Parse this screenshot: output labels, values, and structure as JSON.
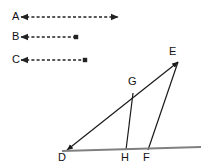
{
  "figure": {
    "background_color": "#ffffff",
    "stroke_color": "#1a1a1a",
    "baseline_color": "#808080",
    "dash_color": "#222222"
  },
  "rays": [
    {
      "label": "A",
      "label_x": 12,
      "label_y": 11,
      "x1": 21,
      "y1": 17,
      "x2": 118,
      "y2": 17,
      "arrow_start": true,
      "arrow_end": true,
      "style": "dashed",
      "name": "ray-a"
    },
    {
      "label": "B",
      "label_x": 12,
      "label_y": 31,
      "x1": 21,
      "y1": 37,
      "x2": 76,
      "y2": 37,
      "arrow_start": true,
      "arrow_end": false,
      "style": "dashed",
      "name": "ray-b"
    },
    {
      "label": "C",
      "label_x": 12,
      "label_y": 54,
      "x1": 21,
      "y1": 60,
      "x2": 85,
      "y2": 60,
      "arrow_start": true,
      "arrow_end": false,
      "style": "dashed",
      "name": "ray-c"
    }
  ],
  "points": [
    {
      "label": "D",
      "x": 67,
      "y": 150,
      "label_x": 58,
      "label_y": 152,
      "name": "point-d"
    },
    {
      "label": "E",
      "x": 178,
      "y": 62,
      "label_x": 169,
      "label_y": 46,
      "name": "point-e"
    },
    {
      "label": "G",
      "x": 133,
      "y": 93,
      "label_x": 128,
      "label_y": 76,
      "name": "point-g"
    },
    {
      "label": "H",
      "x": 126,
      "y": 150,
      "label_x": 121,
      "label_y": 152,
      "name": "point-h"
    },
    {
      "label": "F",
      "x": 148,
      "y": 150,
      "label_x": 143,
      "label_y": 152,
      "name": "point-f"
    }
  ],
  "segments": [
    {
      "name": "segment-de",
      "from": "D",
      "to": "E",
      "x1": 67,
      "y1": 150,
      "x2": 178,
      "y2": 62,
      "arrow_start": true,
      "arrow_end": true
    },
    {
      "name": "segment-gh",
      "from": "G",
      "to": "H",
      "x1": 133,
      "y1": 93,
      "x2": 126,
      "y2": 150,
      "arrow_start": false,
      "arrow_end": false
    },
    {
      "name": "segment-ef",
      "from": "E",
      "to": "F",
      "x1": 178,
      "y1": 62,
      "x2": 148,
      "y2": 150,
      "arrow_start": false,
      "arrow_end": false
    },
    {
      "name": "baseline",
      "from": "left",
      "to": "right",
      "x1": 62,
      "y1": 151,
      "x2": 201,
      "y2": 147,
      "arrow_start": false,
      "arrow_end": false
    }
  ]
}
